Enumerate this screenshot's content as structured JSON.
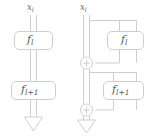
{
  "figure": {
    "type": "diagram",
    "stroke_color": "#c9c9c9",
    "fill_color": "#ffffff",
    "text_color": "#606060",
    "background": "#ffffff",
    "width": 146,
    "height": 137
  },
  "panels": [
    {
      "id": "plain",
      "name": "plain-sequential-block",
      "input_label": {
        "base": "x",
        "sub": "l"
      },
      "blocks": [
        {
          "id": "plain-f-l",
          "base": "f",
          "sub": "l"
        },
        {
          "id": "plain-f-l1",
          "base": "f",
          "sub": "l+1"
        }
      ],
      "adders": [],
      "output_arrow": "down-block-arrow"
    },
    {
      "id": "residual",
      "name": "residual-block",
      "input_label": {
        "base": "x",
        "sub": "l"
      },
      "blocks": [
        {
          "id": "res-f-l",
          "base": "f",
          "sub": "l"
        },
        {
          "id": "res-f-l1",
          "base": "f",
          "sub": "l+1"
        }
      ],
      "adders": [
        {
          "id": "adder-1",
          "symbol": "+"
        },
        {
          "id": "adder-2",
          "symbol": "+"
        }
      ],
      "output_arrow": "down-block-arrow"
    }
  ]
}
